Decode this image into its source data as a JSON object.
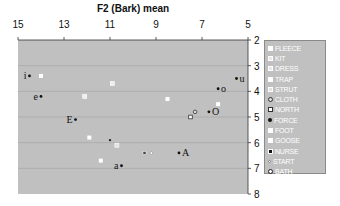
{
  "chart_data": {
    "type": "scatter",
    "title": "",
    "xlabel": "F2 (Bark) mean",
    "ylabel": "F1 (Bark) mean",
    "x_axis": {
      "position": "top",
      "reversed": true,
      "range": [
        15,
        5
      ],
      "ticks": [
        15,
        13,
        11,
        9,
        7,
        5
      ]
    },
    "y_axis": {
      "position": "right",
      "reversed": true,
      "range": [
        2,
        8
      ],
      "ticks": [
        2,
        3,
        4,
        5,
        6,
        7,
        8
      ]
    },
    "grid": {
      "horizontal": true,
      "vertical": false
    },
    "legend_position": "right",
    "plot_background": "#c0c0c0",
    "vowel_labels": [
      {
        "label": "i",
        "f2": 14.5,
        "f1": 3.4
      },
      {
        "label": "e",
        "f2": 14.0,
        "f1": 4.2
      },
      {
        "label": "E",
        "f2": 12.5,
        "f1": 5.1
      },
      {
        "label": "a",
        "f2": 10.5,
        "f1": 6.9
      },
      {
        "label": "A",
        "f2": 8.0,
        "f1": 6.4
      },
      {
        "label": "O",
        "f2": 6.7,
        "f1": 4.8
      },
      {
        "label": "o",
        "f2": 6.3,
        "f1": 3.9
      },
      {
        "label": "u",
        "f2": 5.5,
        "f1": 3.5
      }
    ],
    "series": [
      {
        "name": "FLEECE",
        "marker": "sq-white",
        "points": [
          [
            14.0,
            3.4
          ]
        ]
      },
      {
        "name": "KIT",
        "marker": "sq-light",
        "points": [
          [
            10.9,
            3.7
          ]
        ]
      },
      {
        "name": "DRESS",
        "marker": "sq-light",
        "points": [
          [
            12.1,
            4.2
          ]
        ]
      },
      {
        "name": "TRAP",
        "marker": "sq-white",
        "points": [
          [
            11.9,
            5.8
          ]
        ]
      },
      {
        "name": "STRUT",
        "marker": "sq-dot",
        "points": [
          [
            10.7,
            6.1
          ]
        ]
      },
      {
        "name": "CLOTH",
        "marker": "circ-dark",
        "points": [
          [
            7.3,
            4.8
          ]
        ]
      },
      {
        "name": "NORTH",
        "marker": "sq-dark-outline",
        "points": [
          [
            7.5,
            5.0
          ]
        ]
      },
      {
        "name": "FORCE",
        "marker": "dot-black",
        "points": [
          [
            11.0,
            5.9
          ]
        ]
      },
      {
        "name": "FOOT",
        "marker": "sq-white",
        "points": [
          [
            8.5,
            4.3
          ]
        ]
      },
      {
        "name": "GOOSE",
        "marker": "sq-white",
        "points": [
          [
            11.4,
            6.7
          ],
          [
            6.3,
            4.5
          ]
        ]
      },
      {
        "name": "NURSE",
        "marker": "sq-black",
        "points": [
          [
            9.5,
            6.4
          ]
        ]
      },
      {
        "name": "START",
        "marker": "dot-small",
        "points": [
          [
            9.2,
            6.4
          ]
        ]
      },
      {
        "name": "BATH",
        "marker": "circ-outline",
        "points": []
      }
    ]
  },
  "legend": {
    "items": [
      {
        "label": "FLEECE",
        "marker": "sq-white"
      },
      {
        "label": "KIT",
        "marker": "sq-light"
      },
      {
        "label": "DRESS",
        "marker": "sq-light"
      },
      {
        "label": "TRAP",
        "marker": "sq-white"
      },
      {
        "label": "STRUT",
        "marker": "sq-dot"
      },
      {
        "label": "CLOTH",
        "marker": "circ-dark"
      },
      {
        "label": "NORTH",
        "marker": "sq-dark-outline"
      },
      {
        "label": "FORCE",
        "marker": "dot-black"
      },
      {
        "label": "FOOT",
        "marker": "sq-white"
      },
      {
        "label": "GOOSE",
        "marker": "sq-white"
      },
      {
        "label": "NURSE",
        "marker": "sq-black"
      },
      {
        "label": "START",
        "marker": "dot-small"
      },
      {
        "label": "BATH",
        "marker": "circ-outline"
      }
    ]
  }
}
